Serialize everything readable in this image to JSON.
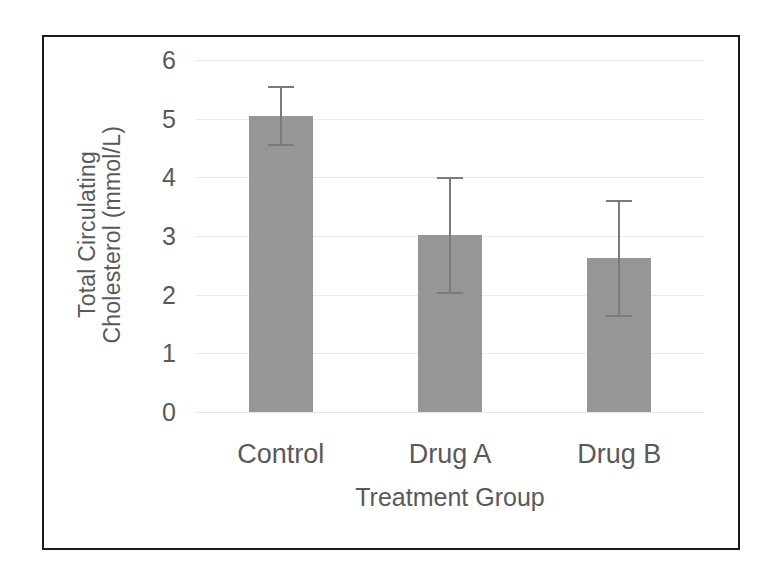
{
  "figure": {
    "border_color": "#1a1a1a",
    "background": "#ffffff"
  },
  "chart_data": {
    "type": "bar",
    "title": "",
    "categories": [
      "Control",
      "Drug A",
      "Drug B"
    ],
    "values": [
      5.05,
      3.01,
      2.62
    ],
    "errors": [
      0.51,
      1.0,
      1.0
    ],
    "error_type": "symmetric",
    "xlabel": "Treatment Group",
    "ylabel": "Total Circulating Cholesterol (mmol/L)",
    "ylabel_lines": [
      "Total Circulating",
      "Cholesterol (mmol/L)"
    ],
    "ylim": [
      0,
      6
    ],
    "ytick_labels": [
      "6",
      "5",
      "4",
      "3",
      "2",
      "1",
      "0"
    ],
    "ytick_values": [
      6,
      5,
      4,
      3,
      2,
      1,
      0
    ],
    "grid": true,
    "grid_axis": "y",
    "grid_color": "#e9e9e9",
    "legend": null,
    "bar_color": "#969696",
    "error_bar_color": "#7a7a7a",
    "text_color": "#595959",
    "series": [
      {
        "name": "Total Circulating Cholesterol",
        "values": [
          5.05,
          3.01,
          2.62
        ],
        "errors": [
          0.51,
          1.0,
          1.0
        ]
      }
    ],
    "points": [
      {
        "category": "Control",
        "value": 5.05,
        "error": 0.51,
        "lower": 4.54,
        "upper": 5.56
      },
      {
        "category": "Drug A",
        "value": 3.01,
        "error": 1.0,
        "lower": 2.01,
        "upper": 4.01
      },
      {
        "category": "Drug B",
        "value": 2.62,
        "error": 1.0,
        "lower": 1.62,
        "upper": 3.62
      }
    ]
  }
}
